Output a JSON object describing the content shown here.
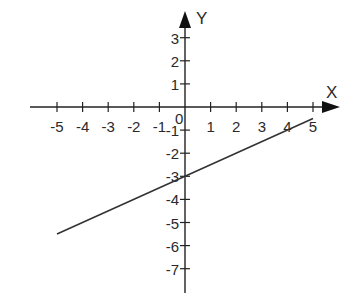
{
  "chart_data": {
    "type": "line",
    "title": "",
    "xlabel": "X",
    "ylabel": "Y",
    "origin_label": "0",
    "xlim": [
      -5,
      5
    ],
    "ylim": [
      -7,
      3
    ],
    "x_ticks": [
      -5,
      -4,
      -3,
      -2,
      -1,
      1,
      2,
      3,
      4,
      5
    ],
    "x_tick_labels": [
      "-5",
      "-4",
      "-3",
      "-2",
      "-1",
      "1",
      "2",
      "3",
      "4",
      "5"
    ],
    "y_ticks": [
      3,
      2,
      1,
      -1,
      -2,
      -3,
      -4,
      -5,
      -6,
      -7
    ],
    "y_tick_labels": [
      "3",
      "2",
      "1",
      "-1",
      "-2",
      "-3",
      "-4",
      "-5",
      "-6",
      "-7"
    ],
    "grid": false,
    "legend": null,
    "series": [
      {
        "name": "y = 0.5x - 3",
        "x": [
          -5,
          0,
          5
        ],
        "y": [
          -5.5,
          -3,
          -0.5
        ],
        "color": "#333333"
      }
    ]
  },
  "colors": {
    "axis": "#222222",
    "line": "#333333",
    "background": "#ffffff"
  }
}
